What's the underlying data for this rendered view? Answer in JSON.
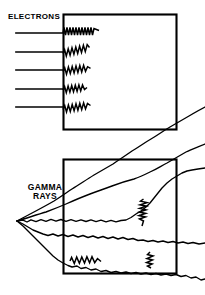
{
  "figure": {
    "title_visible": false,
    "background_color": "#ffffff",
    "stroke_color": "#000000",
    "width": 205,
    "height": 295
  },
  "panels": [
    {
      "id": "electrons-panel",
      "label": "ELECTRONS",
      "label_position": {
        "x": 8,
        "y": 13
      },
      "box": {
        "x": 63,
        "y": 14,
        "width": 114,
        "height": 116
      },
      "description": "Five straight horizontal electron tracks entering the left face of the absorber block and terminating in short zigzag scattering squiggles just inside the left edge.",
      "beam_count": 5,
      "beam_lines": [
        {
          "x1": 16,
          "y1": 33,
          "x2": 63,
          "y2": 33
        },
        {
          "x1": 16,
          "y1": 52,
          "x2": 63,
          "y2": 52
        },
        {
          "x1": 16,
          "y1": 70,
          "x2": 63,
          "y2": 70
        },
        {
          "x1": 16,
          "y1": 89,
          "x2": 63,
          "y2": 89
        },
        {
          "x1": 16,
          "y1": 107,
          "x2": 63,
          "y2": 107
        }
      ],
      "squiggles": [
        {
          "x": 63,
          "y": 31,
          "length": 36,
          "angle": 0,
          "amplitude": 3.4,
          "period": 3.1
        },
        {
          "x": 63,
          "y": 52,
          "length": 31,
          "angle": -19,
          "amplitude": 3.2,
          "period": 3.4
        },
        {
          "x": 63,
          "y": 70,
          "length": 29,
          "angle": -11,
          "amplitude": 3.2,
          "period": 3.4
        },
        {
          "x": 63,
          "y": 89,
          "length": 25,
          "angle": -5,
          "amplitude": 3.0,
          "period": 3.2
        },
        {
          "x": 63,
          "y": 108,
          "length": 30,
          "angle": -14,
          "amplitude": 3.3,
          "period": 3.4
        }
      ]
    },
    {
      "id": "gamma-rays-panel",
      "label": "GAMMA\nRAYS",
      "label_position": {
        "x": 19,
        "y": 183
      },
      "box": {
        "x": 63,
        "y": 159,
        "width": 114,
        "height": 115
      },
      "description": "Gamma ray tracks fan out from a single point source at left, travel as long wavy lines deep through and beyond the absorber block, with occasional short zigzag interaction points inside.",
      "source_point": {
        "x": 17,
        "y": 221
      },
      "ray_count": 5,
      "rays": [
        {
          "name": "ray-up-steep",
          "end": {
            "x": 205,
            "y": 143
          }
        },
        {
          "name": "ray-up-shallow",
          "end": {
            "x": 205,
            "y": 186
          }
        },
        {
          "name": "ray-horizontal",
          "end": {
            "x": 205,
            "y": 219
          }
        },
        {
          "name": "ray-down-shallow",
          "end": {
            "x": 205,
            "y": 245
          }
        },
        {
          "name": "ray-down-steep",
          "end": {
            "x": 205,
            "y": 272
          }
        }
      ],
      "interaction_squiggles": [
        {
          "name": "interaction-upper-right",
          "x": 143,
          "y": 200,
          "length": 28,
          "angle": 78,
          "amplitude": 3.0,
          "period": 3.0
        },
        {
          "name": "interaction-lower-left",
          "x": 70,
          "y": 262,
          "length": 26,
          "angle": 19,
          "amplitude": 3.0,
          "period": 3.0
        },
        {
          "name": "interaction-lower-right",
          "x": 151,
          "y": 256,
          "length": 16,
          "angle": 64,
          "amplitude": 3.0,
          "period": 3.0
        }
      ]
    }
  ]
}
